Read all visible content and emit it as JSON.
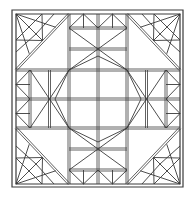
{
  "diagram": {
    "stroke_color": "#3a3a3a",
    "background": "#ffffff",
    "outer_frame": {
      "x": 12,
      "y": 10,
      "w": 171,
      "h": 177
    },
    "inner_frame": {
      "x": 16,
      "y": 14,
      "w": 164,
      "h": 170
    },
    "grid_x": [
      16,
      69,
      98,
      127,
      180
    ],
    "grid_y": [
      14,
      70,
      99,
      128,
      184
    ]
  }
}
